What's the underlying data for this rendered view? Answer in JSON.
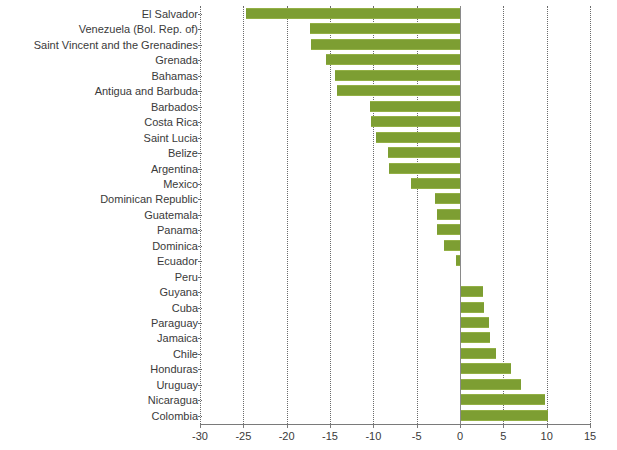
{
  "chart_data": {
    "type": "bar",
    "orientation": "horizontal",
    "title": "",
    "subtitle": "",
    "xlabel": "",
    "ylabel": "",
    "xlim": [
      -30,
      15
    ],
    "xticks": [
      -30,
      -25,
      -20,
      -15,
      -10,
      -5,
      0,
      5,
      10,
      15
    ],
    "xtick_labels": [
      "-30",
      "-25",
      "-20",
      "-15",
      "-10",
      "-5",
      "0",
      "5",
      "10",
      "15"
    ],
    "grid": true,
    "grid_style": "dotted-vertical",
    "legend": null,
    "bar_color": "#7d9e32",
    "categories": [
      "El Salvador",
      "Venezuela (Bol. Rep. of)",
      "Saint Vincent and the Grenadines",
      "Grenada",
      "Bahamas",
      "Antigua and Barbuda",
      "Barbados",
      "Costa Rica",
      "Saint Lucia",
      "Belize",
      "Argentina",
      "Mexico",
      "Dominican Republic",
      "Guatemala",
      "Panama",
      "Dominica",
      "Ecuador",
      "Peru",
      "Guyana",
      "Cuba",
      "Paraguay",
      "Jamaica",
      "Chile",
      "Honduras",
      "Uruguay",
      "Nicaragua",
      "Colombia"
    ],
    "values": [
      -24.7,
      -17.3,
      -17.2,
      -15.5,
      -14.4,
      -14.2,
      -10.4,
      -10.3,
      -9.7,
      -8.3,
      -8.2,
      -5.7,
      -2.9,
      -2.7,
      -2.6,
      -1.8,
      -0.5,
      0.0,
      2.7,
      2.8,
      3.4,
      3.5,
      4.1,
      5.9,
      7.0,
      9.8,
      10.2
    ]
  }
}
